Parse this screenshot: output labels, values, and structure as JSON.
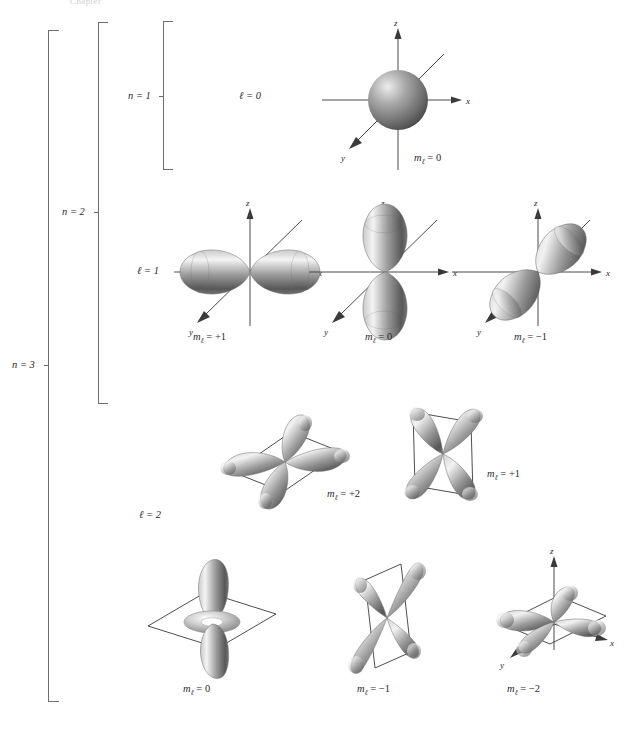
{
  "figure": {
    "top_note": "Chapter"
  },
  "brackets": [
    {
      "id": "n3",
      "label": "n = 3"
    },
    {
      "id": "n2",
      "label": "n = 2"
    },
    {
      "id": "n1",
      "label": "n = 1"
    }
  ],
  "subshells": [
    {
      "id": "l0",
      "label": "ℓ = 0"
    },
    {
      "id": "l1",
      "label": "ℓ = 1"
    },
    {
      "id": "l2",
      "label": "ℓ = 2"
    }
  ],
  "axis_labels": {
    "z": "z",
    "x": "x",
    "y": "y"
  },
  "orbitals": [
    {
      "id": "s-m0",
      "shell": "n = 1",
      "subshell": "ℓ = 0",
      "m_label": "m",
      "m_sub": "ℓ",
      "m_value": "= 0",
      "shape": "sphere",
      "caption": "mℓ = 0"
    },
    {
      "id": "p-mplus1",
      "shell": "n = 2",
      "subshell": "ℓ = 1",
      "m_label": "m",
      "m_sub": "ℓ",
      "m_value": "= +1",
      "shape": "dumbbell-x",
      "caption": "mℓ = +1"
    },
    {
      "id": "p-m0",
      "shell": "n = 2",
      "subshell": "ℓ = 1",
      "m_label": "m",
      "m_sub": "ℓ",
      "m_value": "= 0",
      "shape": "dumbbell-z",
      "caption": "mℓ = 0"
    },
    {
      "id": "p-mminus1",
      "shell": "n = 2",
      "subshell": "ℓ = 1",
      "m_label": "m",
      "m_sub": "ℓ",
      "m_value": "= −1",
      "shape": "dumbbell-y",
      "caption": "mℓ = −1"
    },
    {
      "id": "d-mplus2",
      "shell": "n = 3",
      "subshell": "ℓ = 2",
      "m_label": "m",
      "m_sub": "ℓ",
      "m_value": "= +2",
      "shape": "clover-horizontal",
      "caption": "mℓ = +2"
    },
    {
      "id": "d-mplus1",
      "shell": "n = 3",
      "subshell": "ℓ = 2",
      "m_label": "m",
      "m_sub": "ℓ",
      "m_value": "= +1",
      "shape": "clover-upright",
      "caption": "mℓ = +1"
    },
    {
      "id": "d-m0",
      "shell": "n = 3",
      "subshell": "ℓ = 2",
      "m_label": "m",
      "m_sub": "ℓ",
      "m_value": "= 0",
      "shape": "dz2-torus",
      "caption": "mℓ = 0"
    },
    {
      "id": "d-mminus1",
      "shell": "n = 3",
      "subshell": "ℓ = 2",
      "m_label": "m",
      "m_sub": "ℓ",
      "m_value": "= −1",
      "shape": "clover-vertical",
      "caption": "mℓ = −1"
    },
    {
      "id": "d-mminus2",
      "shell": "n = 3",
      "subshell": "ℓ = 2",
      "m_label": "m",
      "m_sub": "ℓ",
      "m_value": "= −2",
      "shape": "clover-plane-axes",
      "caption": "mℓ = −2"
    }
  ],
  "colors": {
    "lobe_light": "#f2f2f2",
    "lobe_mid": "#9a9a9a",
    "lobe_dark": "#4a4a4a",
    "axis": "#4a4a4a",
    "bracket": "#6d6d6d",
    "text": "#2b2b2b",
    "background": "#ffffff"
  }
}
